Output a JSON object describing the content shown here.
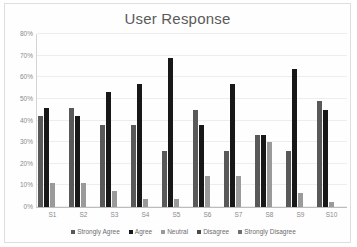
{
  "chart_data": {
    "type": "bar",
    "title": "User Response",
    "xlabel": "",
    "ylabel": "",
    "ylim": [
      0,
      80
    ],
    "ytick_values": [
      0,
      10,
      20,
      30,
      40,
      50,
      60,
      70,
      80
    ],
    "ytick_labels": [
      "0%",
      "10%",
      "20%",
      "30%",
      "40%",
      "50%",
      "60%",
      "70%",
      "80%"
    ],
    "grid": true,
    "legend_position": "bottom",
    "categories": [
      "S1",
      "S2",
      "S3",
      "S4",
      "S5",
      "S6",
      "S7",
      "S8",
      "S9",
      "S10"
    ],
    "series": [
      {
        "name": "Strongly Agree",
        "color": "#595959",
        "values": [
          42,
          46,
          38,
          38,
          26,
          45,
          26,
          33.5,
          26,
          49
        ]
      },
      {
        "name": "Agree",
        "color": "#181818",
        "values": [
          46,
          42,
          53,
          57,
          69,
          38,
          57,
          33.5,
          64,
          45
        ]
      },
      {
        "name": "Neutral",
        "color": "#9a9a9a",
        "values": [
          11,
          11,
          7.5,
          3.5,
          3.5,
          14.5,
          14.5,
          30,
          6.5,
          2.5
        ]
      },
      {
        "name": "Disagree",
        "color": "#4a4a4a",
        "values": [
          0,
          0,
          0,
          0,
          0,
          0,
          0,
          0,
          0,
          0
        ]
      },
      {
        "name": "Strongly Disagree",
        "color": "#6e6e6e",
        "values": [
          0,
          0,
          0,
          0,
          0,
          0,
          0,
          0,
          0,
          0
        ]
      }
    ]
  }
}
